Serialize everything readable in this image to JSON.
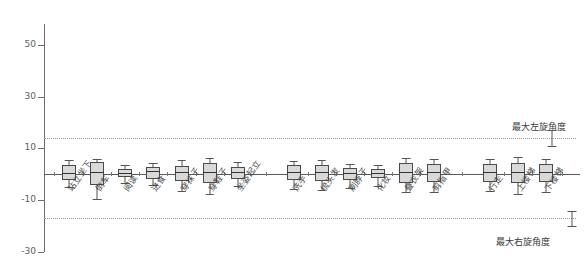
{
  "chart_data": {
    "type": "boxplot",
    "title": "",
    "xlabel": "",
    "ylabel": "",
    "ylim": [
      -30,
      58
    ],
    "yticks": [
      50,
      30,
      10,
      -10,
      -30
    ],
    "ytick_labels": [
      "50",
      "30",
      "10",
      "-10",
      "-30"
    ],
    "grid": false,
    "legend_position": "right-inline",
    "reference_lines": [
      {
        "name": "max-left-rotation",
        "value": 14,
        "label": "最大左旋角度",
        "style": "dotted"
      },
      {
        "name": "max-right-rotation",
        "value": -17,
        "label": "最大右旋角度",
        "style": "dotted"
      }
    ],
    "annotation_markers": [
      {
        "name": "left-rotation-marker",
        "center": 14,
        "low": 11,
        "high": 17
      },
      {
        "name": "right-rotation-marker",
        "center": -17,
        "low": -20,
        "high": -14
      }
    ],
    "categories": [
      "站立坐下",
      "倒车",
      "阅读",
      "进食",
      "穿袜子",
      "穿鞋子",
      "坐姿起立",
      "洗手",
      "梳头发",
      "刷脖子",
      "化妆",
      "叠衣架",
      "剪指甲",
      "行走",
      "上楼梯",
      "下楼梯"
    ],
    "groups": [
      {
        "name": "group-1",
        "categories": [
          "站立坐下",
          "倒车",
          "阅读",
          "进食",
          "穿袜子",
          "穿鞋子",
          "坐姿起立"
        ]
      },
      {
        "name": "group-2",
        "categories": [
          "洗手",
          "梳头发",
          "刷脖子",
          "化妆",
          "叠衣架",
          "剪指甲"
        ]
      },
      {
        "name": "group-3",
        "categories": [
          "行走",
          "上楼梯",
          "下楼梯"
        ]
      }
    ],
    "boxes": [
      {
        "category": "站立坐下",
        "whisker_low": -5.0,
        "q1": -2.2,
        "median": 0.6,
        "q3": 3.4,
        "whisker_high": 5.4
      },
      {
        "category": "倒车",
        "whisker_low": -9.6,
        "q1": -4.2,
        "median": 1.0,
        "q3": 4.6,
        "whisker_high": 6.0
      },
      {
        "category": "阅读",
        "whisker_low": -3.2,
        "q1": -1.2,
        "median": 0.5,
        "q3": 2.1,
        "whisker_high": 3.6
      },
      {
        "category": "进食",
        "whisker_low": -4.3,
        "q1": -1.8,
        "median": 1.1,
        "q3": 3.0,
        "whisker_high": 4.4
      },
      {
        "category": "穿袜子",
        "whisker_low": -6.6,
        "q1": -2.6,
        "median": 0.8,
        "q3": 3.3,
        "whisker_high": 5.4
      },
      {
        "category": "穿鞋子",
        "whisker_low": -7.6,
        "q1": -3.4,
        "median": 0.7,
        "q3": 4.3,
        "whisker_high": 6.4
      },
      {
        "category": "坐姿起立",
        "whisker_low": -4.6,
        "q1": -1.9,
        "median": 0.9,
        "q3": 2.9,
        "whisker_high": 4.6
      },
      {
        "category": "洗手",
        "whisker_low": -5.6,
        "q1": -2.4,
        "median": 0.8,
        "q3": 3.4,
        "whisker_high": 5.2
      },
      {
        "category": "梳头发",
        "whisker_low": -6.2,
        "q1": -2.6,
        "median": 1.0,
        "q3": 3.6,
        "whisker_high": 5.4
      },
      {
        "category": "刷脖子",
        "whisker_low": -5.4,
        "q1": -2.2,
        "median": 0.5,
        "q3": 2.4,
        "whisker_high": 4.0
      },
      {
        "category": "化妆",
        "whisker_low": -4.4,
        "q1": -1.6,
        "median": 0.6,
        "q3": 2.2,
        "whisker_high": 3.6
      },
      {
        "category": "叠衣架",
        "whisker_low": -7.0,
        "q1": -3.2,
        "median": 0.9,
        "q3": 4.2,
        "whisker_high": 6.2
      },
      {
        "category": "剪指甲",
        "whisker_low": -6.8,
        "q1": -3.0,
        "median": 1.0,
        "q3": 4.0,
        "whisker_high": 6.0
      },
      {
        "category": "行走",
        "whisker_low": -6.6,
        "q1": -2.8,
        "median": 0.8,
        "q3": 3.8,
        "whisker_high": 5.8
      },
      {
        "category": "上楼梯",
        "whisker_low": -7.6,
        "q1": -3.4,
        "median": 1.0,
        "q3": 4.4,
        "whisker_high": 6.6
      },
      {
        "category": "下楼梯",
        "whisker_low": -7.0,
        "q1": -3.0,
        "median": 0.9,
        "q3": 4.0,
        "whisker_high": 6.0
      }
    ]
  },
  "colors": {
    "box_fill": "#d9d9d9",
    "box_stroke": "#4a4a4a",
    "axis": "#6e6e6e",
    "reference": "#9a9a9a",
    "text": "#3a3a3a"
  }
}
